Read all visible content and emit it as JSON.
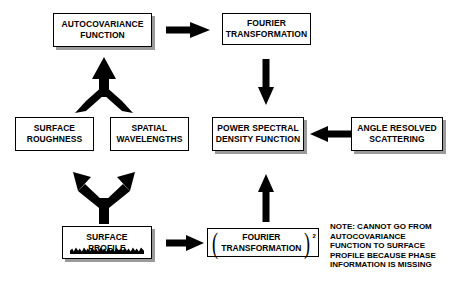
{
  "diagram": {
    "boxes": {
      "autocovariance": "AUTOCOVARIANCE\nFUNCTION",
      "fourier_top": "FOURIER\nTRANSFORMATION",
      "surface_roughness": "SURFACE\nROUGHNESS",
      "spatial_wavelengths": "SPATIAL\nWAVELENGTHS",
      "psd": "POWER SPECTRAL\nDENSITY FUNCTION",
      "angle_resolved": "ANGLE RESOLVED\nSCATTERING",
      "surface_profile": "SURFACE\nPROFILE",
      "fourier_squared": "FOURIER\nTRANSFORMATION",
      "fourier_squared_exponent": "2",
      "fourier_squared_open_paren": "(",
      "fourier_squared_close_paren": ")"
    },
    "note": "NOTE: CANNOT GO FROM\nAUTOCOVARIANCE\nFUNCTION TO SURFACE\nPROFILE BECAUSE PHASE\nINFORMATION IS MISSING",
    "colors": {
      "line": "#000000",
      "background": "#ffffff",
      "shadow": "#9a9a9a"
    }
  }
}
